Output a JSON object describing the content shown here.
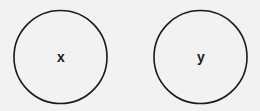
{
  "diagram": {
    "nodes": [
      {
        "id": "x",
        "label": "x",
        "cx": 60.5,
        "cy": 57,
        "r": 46.5
      },
      {
        "id": "y",
        "label": "y",
        "cx": 200.5,
        "cy": 57,
        "r": 46.5
      }
    ],
    "colors": {
      "stroke": "#1a1a1a",
      "background": "#f2f2f2"
    }
  }
}
